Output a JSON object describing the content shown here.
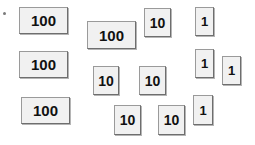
{
  "diagram": {
    "background_color": "#ffffff",
    "card_fill_color": "#f1f1f1",
    "card_border_color": "#9a9a9a",
    "card_shadow_color": "#6e6e6e",
    "text_color": "#111111",
    "marker": {
      "name": "corner-dot",
      "x": 3,
      "y": 12
    },
    "groups": [
      {
        "name": "hundreds",
        "value": 100,
        "count": 4
      },
      {
        "name": "tens",
        "value": 10,
        "count": 5
      },
      {
        "name": "ones",
        "value": 1,
        "count": 4
      }
    ],
    "cards": [
      {
        "id": "hundred-1",
        "label": "100",
        "place": "hundreds",
        "x": 19,
        "y": 7,
        "w": 49,
        "h": 27
      },
      {
        "id": "hundred-2",
        "label": "100",
        "place": "hundreds",
        "x": 19,
        "y": 51,
        "w": 49,
        "h": 27
      },
      {
        "id": "hundred-3",
        "label": "100",
        "place": "hundreds",
        "x": 21,
        "y": 97,
        "w": 49,
        "h": 27
      },
      {
        "id": "hundred-4",
        "label": "100",
        "place": "hundreds",
        "x": 87,
        "y": 21,
        "w": 49,
        "h": 28
      },
      {
        "id": "ten-1",
        "label": "10",
        "place": "tens",
        "x": 144,
        "y": 8,
        "w": 27,
        "h": 29
      },
      {
        "id": "ten-2",
        "label": "10",
        "place": "tens",
        "x": 93,
        "y": 66,
        "w": 26,
        "h": 29
      },
      {
        "id": "ten-3",
        "label": "10",
        "place": "tens",
        "x": 139,
        "y": 66,
        "w": 27,
        "h": 29
      },
      {
        "id": "ten-4",
        "label": "10",
        "place": "tens",
        "x": 114,
        "y": 105,
        "w": 27,
        "h": 30
      },
      {
        "id": "ten-5",
        "label": "10",
        "place": "tens",
        "x": 158,
        "y": 105,
        "w": 27,
        "h": 30
      },
      {
        "id": "one-1",
        "label": "1",
        "place": "ones",
        "x": 195,
        "y": 7,
        "w": 19,
        "h": 29
      },
      {
        "id": "one-2",
        "label": "1",
        "place": "ones",
        "x": 195,
        "y": 49,
        "w": 19,
        "h": 29
      },
      {
        "id": "one-3",
        "label": "1",
        "place": "ones",
        "x": 222,
        "y": 56,
        "w": 19,
        "h": 29
      },
      {
        "id": "one-4",
        "label": "1",
        "place": "ones",
        "x": 193,
        "y": 95,
        "w": 20,
        "h": 30
      }
    ]
  }
}
